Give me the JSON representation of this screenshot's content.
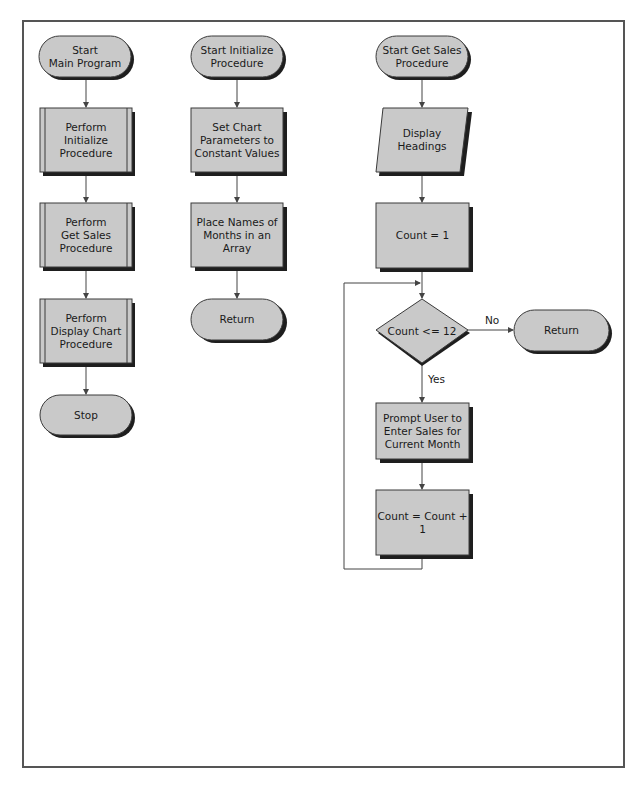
{
  "figure": {
    "colors": {
      "fill": "#c9c9c9",
      "shadow": "#1e1e1e",
      "stroke": "#3a3a3a",
      "line": "#444444",
      "border": "#555555"
    }
  },
  "main_program": {
    "start": "Start\nMain Program",
    "step1": "Perform\nInitialize\nProcedure",
    "step2": "Perform\nGet Sales\nProcedure",
    "step3": "Perform\nDisplay Chart\nProcedure",
    "end": "Stop"
  },
  "initialize_procedure": {
    "start": "Start Initialize\nProcedure",
    "step1": "Set Chart\nParameters to\nConstant Values",
    "step2": "Place Names of\nMonths in an\nArray",
    "end": "Return"
  },
  "get_sales_procedure": {
    "start": "Start Get Sales\nProcedure",
    "io": "Display\nHeadings",
    "init": "Count = 1",
    "decision": "Count <= 12",
    "no_label": "No",
    "yes_label": "Yes",
    "exit": "Return",
    "prompt": "Prompt User to\nEnter Sales for\nCurrent Month",
    "increment": "Count = Count + 1"
  }
}
